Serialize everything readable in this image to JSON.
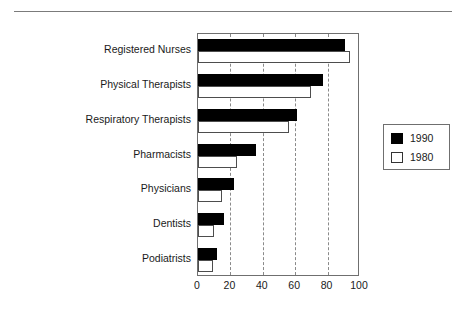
{
  "chart_data": {
    "type": "bar",
    "orientation": "horizontal",
    "title": "",
    "subtitle": "",
    "xlabel": "",
    "ylabel": "",
    "categories": [
      "Registered Nurses",
      "Physical Therapists",
      "Respiratory Therapists",
      "Pharmacists",
      "Physicians",
      "Dentists",
      "Podiatrists"
    ],
    "series": [
      {
        "name": "1990",
        "style": "filled-black",
        "values": [
          91,
          77,
          61,
          36,
          22,
          16,
          12
        ]
      },
      {
        "name": "1980",
        "style": "hollow-white",
        "values": [
          94,
          70,
          56,
          24,
          15,
          10,
          9
        ]
      }
    ],
    "xlim": [
      0,
      100
    ],
    "xticks": [
      0,
      20,
      40,
      60,
      80,
      100
    ],
    "xticklabels": [
      "0",
      "20",
      "40",
      "60",
      "80",
      "100"
    ],
    "gridlines": {
      "x": true,
      "y": false,
      "style": "dashed"
    },
    "legend": {
      "position": "right",
      "entries": [
        {
          "label": "1990",
          "swatch": "filled"
        },
        {
          "label": "1980",
          "swatch": "hollow"
        }
      ]
    },
    "colors": {
      "series_1990": "#000000",
      "series_1980": "#ffffff",
      "axis": "#6f6f6f",
      "grid": "#8a8a8a",
      "text": "#1a1a1a",
      "background": "#ffffff"
    }
  },
  "decorations": {
    "top_rule": true
  }
}
